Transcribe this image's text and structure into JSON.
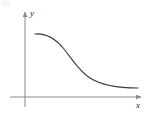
{
  "figure": {
    "name": "decreasing-curve-graph",
    "background_color": "#ffffff",
    "corner_artifact": "(2)"
  },
  "axes": {
    "x_label": "x",
    "y_label": "y",
    "axis_color": "#8a8a8a",
    "origin": {
      "x": 25,
      "y": 97
    },
    "x_axis": {
      "start_x": 10,
      "end_x": 141,
      "y": 97,
      "arrow": true
    },
    "y_axis": {
      "x": 25,
      "start_y": 107,
      "end_y": 12,
      "arrow": true
    }
  },
  "curve": {
    "color": "#3a3a3a",
    "stroke_width": 1.1,
    "start_point": {
      "x": 35,
      "y": 34
    },
    "end_point": {
      "x": 138,
      "y": 88
    },
    "shape": "decreasing-sigmoid"
  },
  "chart_data": {
    "type": "line",
    "title": "",
    "subtitle": "",
    "xlabel": "x",
    "ylabel": "y",
    "grid": false,
    "legend": null,
    "annotations": [],
    "axis_arrows": true,
    "xlim": [
      0,
      10
    ],
    "ylim": [
      0,
      10
    ],
    "xticks": [],
    "yticks": [],
    "series": [
      {
        "name": "decreasing curve",
        "color": "#3a3a3a",
        "description": "Smooth monotonically decreasing S-shaped curve, concave down then concave up, flattening toward a horizontal asymptote above the x-axis",
        "x": [
          0.9,
          1.6,
          2.4,
          3.2,
          4.0,
          4.8,
          5.6,
          6.4,
          7.2,
          8.0,
          8.8,
          9.6,
          10.5
        ],
        "y": [
          7.5,
          7.35,
          7.0,
          6.4,
          5.55,
          4.6,
          3.7,
          2.95,
          2.4,
          2.0,
          1.75,
          1.6,
          1.5
        ]
      }
    ],
    "svg_path": "M 35,34 C 46,33 55,38 64,49 C 72,59 79,71 90,78 C 101,85 118,88 138,88"
  }
}
